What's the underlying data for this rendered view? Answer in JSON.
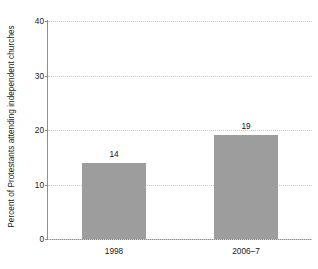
{
  "chart_data": {
    "type": "bar",
    "title": "",
    "subtitle": "",
    "xlabel": "",
    "ylabel": "Percent of Protestants attending independent churches",
    "categories": [
      "1998",
      "2006–7"
    ],
    "values": [
      14,
      19
    ],
    "value_labels": [
      "14",
      "19"
    ],
    "ylim": [
      0,
      40
    ],
    "yticks": [
      0,
      10,
      20,
      30,
      40
    ],
    "ytick_labels": [
      "0",
      "10",
      "20",
      "30",
      "40"
    ],
    "grid": "horizontal-dotted",
    "legend": "none",
    "bar_color": "#9d9d9d",
    "axis_color": "#8f8f8f",
    "gridline_color": "#c9c9c9",
    "background": "#ffffff"
  }
}
